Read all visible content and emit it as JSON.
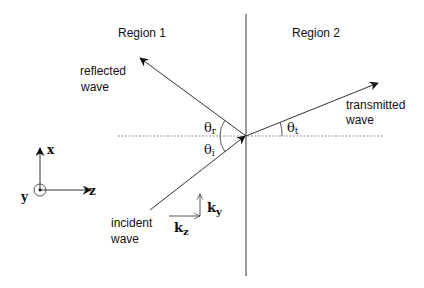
{
  "diagram": {
    "regions": [
      {
        "label": "Region 1"
      },
      {
        "label": "Region 2"
      }
    ],
    "waves": {
      "reflected": {
        "line1": "reflected",
        "line2": "wave"
      },
      "transmitted": {
        "line1": "transmitted",
        "line2": "wave"
      },
      "incident": {
        "line1": "incident",
        "line2": "wave"
      }
    },
    "angles": {
      "reflected": {
        "symbol": "θ",
        "sub": "r"
      },
      "incident": {
        "symbol": "θ",
        "sub": "i"
      },
      "transmitted": {
        "symbol": "θ",
        "sub": "t"
      }
    },
    "wave_vector_components": {
      "ky": {
        "symbol": "k",
        "sub": "y"
      },
      "kz": {
        "symbol": "k",
        "sub": "z"
      }
    },
    "axes": {
      "x": "x",
      "y": "y",
      "z": "z"
    }
  }
}
